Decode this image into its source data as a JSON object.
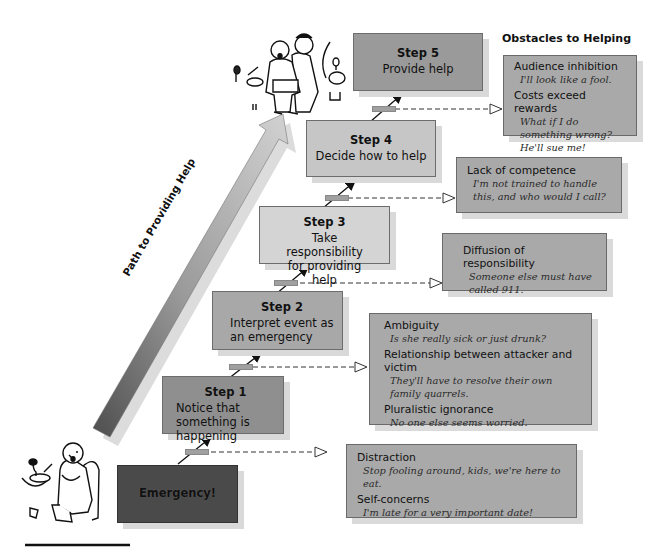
{
  "title": "Obstacles to Helping",
  "path_label": "Path to Providing Help",
  "colors": {
    "emergency_box": "#4a4a4a",
    "step1_box": "#8f8f8f",
    "step2_box": "#a8a8a8",
    "step3_box": "#d4d4d4",
    "step4_box": "#c6c6c6",
    "step5_box": "#9a9a9a",
    "obstacle_box": "#a9a9a9",
    "path_arrow_dark": "#5a5a5a",
    "path_arrow_light": "#c8c8c8"
  },
  "emergency": {
    "label": "Emergency!"
  },
  "steps": [
    {
      "title": "Step 1",
      "desc": "Notice that something is happening"
    },
    {
      "title": "Step 2",
      "desc": "Interpret event as an emergency"
    },
    {
      "title": "Step 3",
      "desc": "Take responsibility for providing help"
    },
    {
      "title": "Step 4",
      "desc": "Decide how to help"
    },
    {
      "title": "Step 5",
      "desc": "Provide help"
    }
  ],
  "obstacles": [
    {
      "items": [
        {
          "heading": "Distraction",
          "quote": "Stop fooling around, kids, we're here to eat."
        },
        {
          "heading": "Self-concerns",
          "quote": "I'm late for a very important date!"
        }
      ]
    },
    {
      "items": [
        {
          "heading": "Ambiguity",
          "quote": "Is she really sick or just drunk?"
        },
        {
          "heading": "Relationship between attacker and victim",
          "quote": "They'll have to resolve their own family quarrels."
        },
        {
          "heading": "Pluralistic ignorance",
          "quote": "No one else seems worried."
        }
      ]
    },
    {
      "items": [
        {
          "heading": "Diffusion of responsibility",
          "quote": "Someone else must have called 911."
        }
      ]
    },
    {
      "items": [
        {
          "heading": "Lack of competence",
          "quote": "I'm not trained to handle this, and who would I call?"
        }
      ]
    },
    {
      "items": [
        {
          "heading": "Audience inhibition",
          "quote": "I'll look like a fool."
        },
        {
          "heading": "Costs exceed rewards",
          "quote": "What if I do something wrong? He'll sue me!"
        }
      ]
    }
  ],
  "illustrations": {
    "bottom_left": "choking-man-at-table",
    "top": "man-performing-heimlich-maneuver"
  }
}
